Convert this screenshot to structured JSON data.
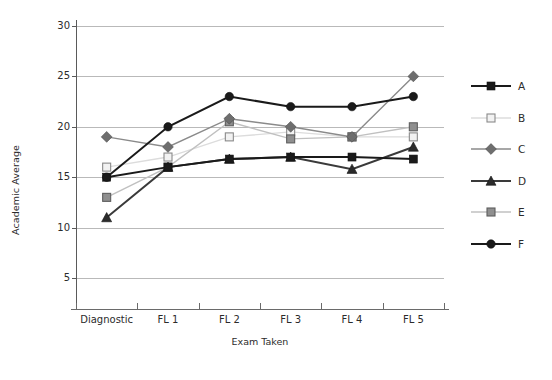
{
  "chart_data": {
    "type": "line",
    "title": "",
    "xlabel": "Exam Taken",
    "ylabel": "Academic Average",
    "categories": [
      "Diagnostic",
      "FL 1",
      "FL 2",
      "FL 3",
      "FL 4",
      "FL 5"
    ],
    "ylim": [
      0,
      30
    ],
    "yticks": [
      5,
      10,
      15,
      20,
      25,
      30
    ],
    "grid": true,
    "legend_position": "right",
    "series": [
      {
        "name": "A",
        "values": [
          15,
          16,
          16.8,
          17,
          17,
          16.8
        ],
        "marker": "filled-square",
        "color": "#1a1a1a",
        "line_color": "#1a1a1a"
      },
      {
        "name": "B",
        "values": [
          16,
          17,
          19,
          19.5,
          19,
          19
        ],
        "marker": "open-square",
        "color": "#e8e8e8",
        "line_color": "#dcdcdc"
      },
      {
        "name": "C",
        "values": [
          19,
          18,
          20.8,
          20,
          19,
          25
        ],
        "marker": "filled-diamond",
        "color": "#6e6e6e",
        "line_color": "#8a8a8a"
      },
      {
        "name": "D",
        "values": [
          11,
          16,
          16.8,
          17,
          15.8,
          18
        ],
        "marker": "filled-triangle",
        "color": "#2b2b2b",
        "line_color": "#3a3a3a"
      },
      {
        "name": "E",
        "values": [
          13,
          16,
          20.5,
          18.8,
          19,
          20
        ],
        "marker": "shaded-square",
        "color": "#8f8f8f",
        "line_color": "#c0c0c0"
      },
      {
        "name": "F",
        "values": [
          15,
          20,
          23,
          22,
          22,
          23
        ],
        "marker": "filled-circle",
        "color": "#1a1a1a",
        "line_color": "#1a1a1a"
      }
    ]
  },
  "legend": {
    "entries": [
      {
        "label": "A"
      },
      {
        "label": "B"
      },
      {
        "label": "C"
      },
      {
        "label": "D"
      },
      {
        "label": "E"
      },
      {
        "label": "F"
      }
    ]
  }
}
